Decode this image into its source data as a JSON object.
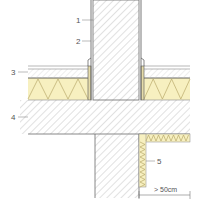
{
  "figure": {
    "labels": [
      {
        "id": "1",
        "text": "1",
        "refers_to": "wall"
      },
      {
        "id": "2",
        "text": "2",
        "refers_to": "wall-lining-membrane"
      },
      {
        "id": "3",
        "text": "3",
        "refers_to": "floor-screed-layer"
      },
      {
        "id": "4",
        "text": "4",
        "refers_to": "concrete-slab"
      },
      {
        "id": "5",
        "text": "5",
        "refers_to": "flanking-insulation-strip"
      }
    ],
    "dimension": {
      "text": "> 50cm",
      "refers_to": "insulation-strip-length"
    },
    "colors": {
      "insulation_fill": "#f7f0c0",
      "insulation_line": "#b9a96a",
      "hatch_line": "#9a9a9a",
      "outline": "#6a6a6a",
      "membrane": "#555555",
      "label_text": "#555555"
    }
  }
}
